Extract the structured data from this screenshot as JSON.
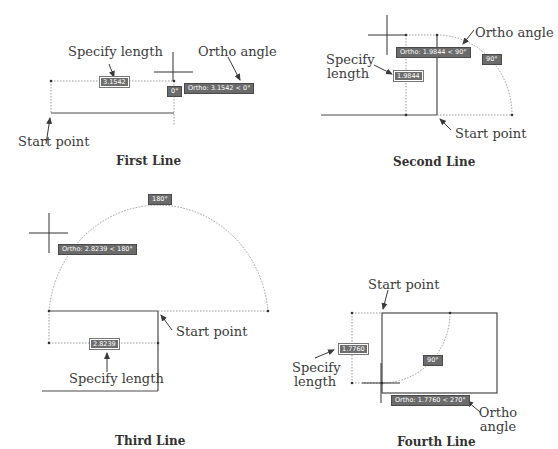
{
  "panels": [
    {
      "caption": "First Line",
      "labels": {
        "specify_length": "Specify length",
        "ortho_angle": "Ortho angle",
        "start_point": "Start point"
      },
      "length_input": "3.1542",
      "angle_badge": "0°",
      "ortho_tooltip": "Ortho: 3.1542 < 0°"
    },
    {
      "caption": "Second Line",
      "labels": {
        "specify_length_1": "Specify",
        "specify_length_2": "length",
        "ortho_angle": "Ortho angle",
        "start_point": "Start point"
      },
      "length_input": "1.9844",
      "angle_badge": "90°",
      "ortho_tooltip": "Ortho: 1.9844 < 90°"
    },
    {
      "caption": "Third Line",
      "labels": {
        "specify_length": "Specify length",
        "start_point": "Start point"
      },
      "length_input": "2.8239",
      "angle_badge": "180°",
      "ortho_tooltip": "Ortho: 2.8239 < 180°"
    },
    {
      "caption": "Fourth Line",
      "labels": {
        "start_point": "Start point",
        "specify_length_1": "Specify",
        "specify_length_2": "length",
        "ortho_angle_1": "Ortho",
        "ortho_angle_2": "angle"
      },
      "length_input": "1.7760",
      "angle_badge": "90°",
      "ortho_tooltip": "Ortho: 1.7760 < 270°"
    }
  ],
  "colors": {
    "line": "#4a4a4a",
    "dotted": "#9a9a9a",
    "tooltip_bg": "#6b6b6b"
  }
}
